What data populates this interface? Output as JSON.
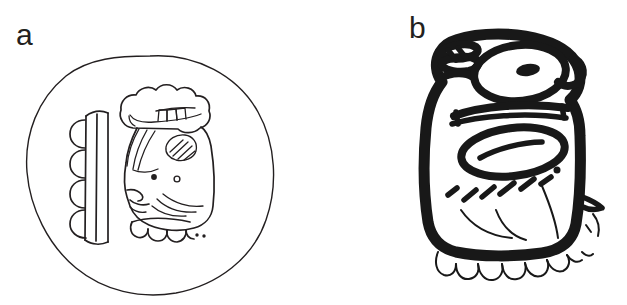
{
  "figure": {
    "background_color": "#ffffff",
    "ink_color": "#231f20",
    "bold_ink_color": "#181818",
    "width": 627,
    "height": 305,
    "style": "black-and-white line drawing of two Maya hieroglyphs"
  },
  "panels": [
    {
      "id": "a",
      "label": "a",
      "subject_name": "seated-head-glyph-in-circular-cartouche",
      "description": "Thin-line drawing of a Maya head glyph enclosed in a hand-drawn circular cartouche. The head faces left, wears a scalloped cloud-like headdress with three small teeth, and has a vertical double-bar with four semicircular lobes at its left.",
      "elements": [
        {
          "name": "circular-cartouche",
          "count": 1
        },
        {
          "name": "scalloped-headdress",
          "count": 1
        },
        {
          "name": "headdress-teeth",
          "count": 3
        },
        {
          "name": "lobe-column",
          "count": 4
        },
        {
          "name": "double-vertical-bar",
          "count": 1
        },
        {
          "name": "hatched-ear-ornament",
          "count": 1
        },
        {
          "name": "eye-dot-solid",
          "count": 1
        },
        {
          "name": "eye-dot-open",
          "count": 1
        },
        {
          "name": "profile-nose-and-mouth",
          "count": 1
        },
        {
          "name": "jaw-teeth",
          "count": 4
        },
        {
          "name": "speech-dots",
          "count": 2
        }
      ]
    },
    {
      "id": "b",
      "label": "b",
      "subject_name": "bold-brushed-head-glyph",
      "description": "Heavy brush-stroke drawing of a tall rounded-rectangular Maya head glyph. An oval eye with a solid pupil sits in the upper register, a large open oval below it, diagonal hatch dashes across the lower body, and a fringe of thin teeth along the bottom edge.",
      "elements": [
        {
          "name": "glyph-body-outline",
          "count": 1
        },
        {
          "name": "upper-eye-oval",
          "count": 1
        },
        {
          "name": "eye-pupil",
          "count": 1
        },
        {
          "name": "scribbled-crest",
          "count": 1
        },
        {
          "name": "mid-band-stroke",
          "count": 1
        },
        {
          "name": "lower-oval",
          "count": 1
        },
        {
          "name": "hatch-dash",
          "count": 7
        },
        {
          "name": "curved-jaw-line",
          "count": 3
        },
        {
          "name": "bottom-teeth",
          "count": 8
        },
        {
          "name": "right-spur",
          "count": 1
        }
      ]
    }
  ]
}
